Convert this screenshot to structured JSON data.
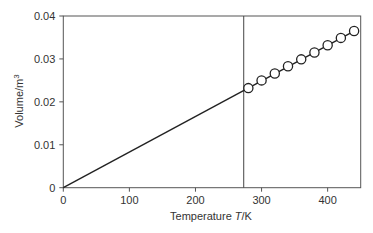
{
  "chart_data": {
    "type": "line",
    "title": "",
    "xlabel": "Temperature T/K",
    "xlabel_parts": {
      "prefix": "Temperature ",
      "var": "T",
      "suffix": "/K"
    },
    "ylabel": "Volume/m3",
    "ylabel_parts": {
      "base": "Volume/m",
      "sup": "3"
    },
    "xlim": [
      0,
      450
    ],
    "ylim": [
      0,
      0.04
    ],
    "x_ticks": [
      0,
      100,
      200,
      300,
      400
    ],
    "x_tick_labels": [
      "0",
      "100",
      "200",
      "300",
      "400"
    ],
    "y_ticks": [
      0,
      0.01,
      0.02,
      0.03,
      0.04
    ],
    "y_tick_labels": [
      "0",
      "0.01",
      "0.02",
      "0.03",
      "0.04"
    ],
    "grid": false,
    "legend": null,
    "annotations": [
      {
        "type": "vertical-line",
        "x": 273
      }
    ],
    "series": [
      {
        "name": "fit line",
        "style": "solid line",
        "x": [
          0,
          440
        ],
        "y": [
          0,
          0.0365
        ]
      },
      {
        "name": "measured",
        "style": "open circles",
        "x": [
          280,
          300,
          320,
          340,
          360,
          380,
          400,
          420,
          440
        ],
        "y": [
          0.0232,
          0.025,
          0.0266,
          0.0283,
          0.0299,
          0.0315,
          0.0332,
          0.0349,
          0.0365
        ]
      }
    ]
  }
}
